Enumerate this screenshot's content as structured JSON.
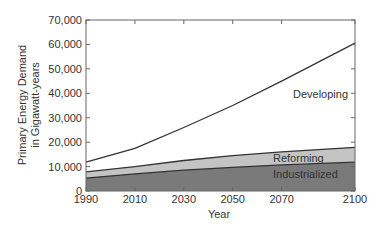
{
  "chart_data": {
    "type": "area",
    "stacked": true,
    "title": "",
    "xlabel": "Year",
    "ylabel": "Primary Energy Demand\nin Gigawatt-years",
    "ylabel_lines": [
      "Primary Energy Demand",
      "in Gigawatt-years"
    ],
    "xlim": [
      1990,
      2100
    ],
    "ylim": [
      0,
      70000
    ],
    "x_ticks": [
      1990,
      2010,
      2030,
      2050,
      2070,
      2100
    ],
    "x_tick_labels": [
      "1990",
      "2010",
      "2030",
      "2050",
      "2070",
      "2100"
    ],
    "y_ticks": [
      0,
      10000,
      20000,
      30000,
      40000,
      50000,
      60000,
      70000
    ],
    "y_tick_labels": [
      "0",
      "10,000",
      "20,000",
      "30,000",
      "40,000",
      "50,000",
      "60,000",
      "70,000"
    ],
    "grid": false,
    "legend": "inline labels on areas",
    "x": [
      1990,
      2010,
      2030,
      2050,
      2070,
      2100
    ],
    "series": [
      {
        "name": "Industrialized",
        "label": "Industrialized",
        "color": "#7a7a7a",
        "cumulative_top": [
          5300,
          7000,
          8500,
          9700,
          10700,
          11800
        ]
      },
      {
        "name": "Reforming",
        "label": "Reforming",
        "color": "#c4c4c4",
        "cumulative_top": [
          7800,
          10000,
          12500,
          14500,
          16000,
          17900
        ]
      },
      {
        "name": "Developing",
        "label": "Developing",
        "color": "#ffffff",
        "cumulative_top": [
          11800,
          17500,
          26000,
          35000,
          45000,
          60500
        ]
      }
    ]
  },
  "labels": {
    "developing": "Developing",
    "reforming": "Reforming",
    "industrialized": "Industrialized"
  }
}
